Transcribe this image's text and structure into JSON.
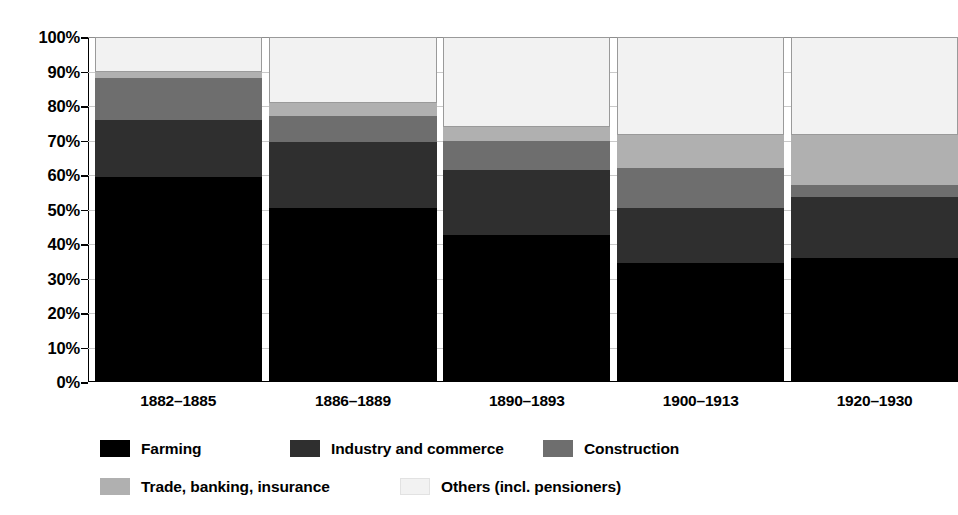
{
  "chart_data": {
    "type": "bar",
    "subtype": "stacked-bar-100-percent",
    "title": "",
    "subtitle": "",
    "xlabel": "",
    "ylabel": "",
    "ylim": [
      0,
      100
    ],
    "yticks": [
      0,
      10,
      20,
      30,
      40,
      50,
      60,
      70,
      80,
      90,
      100
    ],
    "ytick_labels": [
      "0%",
      "10%",
      "20%",
      "30%",
      "40%",
      "50%",
      "60%",
      "70%",
      "80%",
      "90%",
      "100%"
    ],
    "grid": true,
    "legend_position": "bottom",
    "categories": [
      "1882–1885",
      "1886–1889",
      "1890–1893",
      "1900–1913",
      "1920–1930"
    ],
    "series": [
      {
        "name": "Farming",
        "color": "#000000",
        "values": [
          59.5,
          50.3,
          42.6,
          34.5,
          36.0
        ]
      },
      {
        "name": "Industry and commerce",
        "color": "#2f2f2f",
        "values": [
          16.5,
          19.2,
          18.9,
          16.0,
          17.5
        ]
      },
      {
        "name": "Construction",
        "color": "#6e6e6e",
        "values": [
          12.0,
          7.5,
          8.5,
          11.5,
          3.5
        ]
      },
      {
        "name": "Trade, banking, insurance",
        "color": "#b0b0b0",
        "values": [
          2.0,
          4.0,
          4.0,
          9.5,
          14.5
        ]
      },
      {
        "name": "Others (incl. pensioners)",
        "color": "#f2f2f2",
        "values": [
          10.0,
          19.0,
          26.0,
          28.5,
          28.5
        ]
      }
    ]
  },
  "axis": {
    "ytick_labels": [
      "100%",
      "90%",
      "80%",
      "70%",
      "60%",
      "50%",
      "40%",
      "30%",
      "20%",
      "10%",
      "0%"
    ],
    "ytick_values": [
      100,
      90,
      80,
      70,
      60,
      50,
      40,
      30,
      20,
      10,
      0
    ]
  },
  "legend": {
    "items": [
      {
        "label": "Farming",
        "color": "#000000"
      },
      {
        "label": "Industry and commerce",
        "color": "#2f2f2f"
      },
      {
        "label": "Construction",
        "color": "#6e6e6e"
      },
      {
        "label": "Trade, banking, insurance",
        "color": "#b0b0b0"
      },
      {
        "label": "Others (incl. pensioners)",
        "color": "#f2f2f2"
      }
    ],
    "layout": [
      {
        "index": 0,
        "left": 100,
        "top": 0
      },
      {
        "index": 1,
        "left": 290,
        "top": 0
      },
      {
        "index": 2,
        "left": 543,
        "top": 0
      },
      {
        "index": 3,
        "left": 100,
        "top": 38
      },
      {
        "index": 4,
        "left": 400,
        "top": 38
      }
    ]
  },
  "bar_layout": {
    "bars": [
      {
        "index": 0,
        "left_pct": 0.8,
        "width_pct": 20.2
      },
      {
        "index": 1,
        "left_pct": 21.9,
        "width_pct": 20.2
      },
      {
        "index": 2,
        "left_pct": 42.9,
        "width_pct": 20.2
      },
      {
        "index": 3,
        "left_pct": 63.9,
        "width_pct": 20.2
      },
      {
        "index": 4,
        "left_pct": 84.9,
        "width_pct": 20.2
      }
    ]
  }
}
